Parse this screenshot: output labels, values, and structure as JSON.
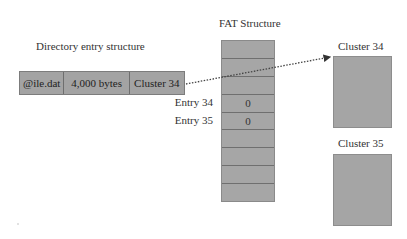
{
  "title_directory": "Directory entry structure",
  "title_fat": "FAT Structure",
  "directory_entry": {
    "cells": [
      {
        "label": "@ile.dat",
        "width": 45
      },
      {
        "label": "4,000 bytes",
        "width": 66
      },
      {
        "label": "Cluster 34",
        "width": 55
      }
    ]
  },
  "fat": {
    "rows": [
      "",
      "",
      "",
      "0",
      "0",
      "",
      "",
      "",
      ""
    ],
    "entry_labels": [
      "Entry 34",
      "Entry 35"
    ]
  },
  "clusters": [
    {
      "label": "Cluster 34"
    },
    {
      "label": "Cluster 35"
    }
  ],
  "colors": {
    "box_fill": "#a5a5a5",
    "arrow": "#333333",
    "text": "#333333"
  }
}
